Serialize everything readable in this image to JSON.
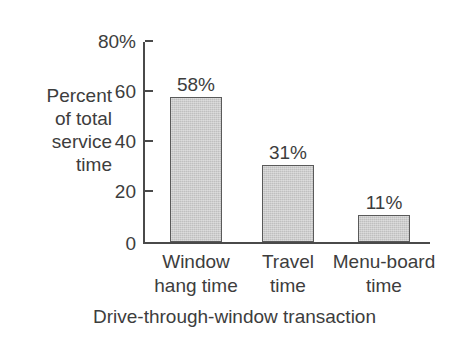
{
  "chart_data": {
    "type": "bar",
    "title": "",
    "subtitle": "",
    "categories": [
      "Window hang time",
      "Travel time",
      "Menu-board time"
    ],
    "category_lines": [
      [
        "Window",
        "hang time"
      ],
      [
        "Travel",
        "time"
      ],
      [
        "Menu-board",
        "time"
      ]
    ],
    "values": [
      58,
      31,
      11
    ],
    "value_labels": [
      "58%",
      "31%",
      "11%"
    ],
    "xlabel": "Drive-through-window transaction",
    "ylabel": "Percent of total service time",
    "ylabel_lines": [
      "Percent",
      "of total",
      "service",
      "time"
    ],
    "ylim": [
      0,
      80
    ],
    "yticks": [
      0,
      20,
      40,
      60,
      80
    ],
    "ytick_labels": [
      "0",
      "20",
      "40",
      "60",
      "80%"
    ],
    "grid": false,
    "legend": false,
    "legend_position": "none",
    "colors": {
      "bar_fill": "#bfbfbf",
      "bar_edge": "#5a5a5a",
      "axis": "#4a4a4a",
      "text": "#3d3d3d",
      "background": "#ffffff"
    }
  }
}
